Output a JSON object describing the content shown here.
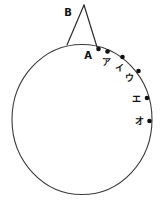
{
  "figure": {
    "labels": {
      "apex": "B",
      "contact_point": "A"
    },
    "points": [
      {
        "label": "ア"
      },
      {
        "label": "イ"
      },
      {
        "label": "ウ"
      },
      {
        "label": "エ"
      },
      {
        "label": "オ"
      }
    ],
    "colors": {
      "line": "#3a3a3a",
      "dot": "#111111",
      "background": "#ffffff",
      "text": "#111111"
    }
  }
}
